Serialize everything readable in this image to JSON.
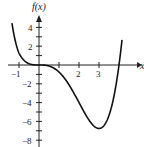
{
  "chart_data": {
    "type": "line",
    "title": "",
    "xlabel": "x",
    "ylabel": "f(x)",
    "x_ticks": [
      -1,
      1,
      2,
      3
    ],
    "x_tick_labels": [
      "-1",
      "",
      "2",
      "3"
    ],
    "y_tick_labels": [
      "4",
      "2",
      "-2",
      "-4",
      "-6",
      "-8"
    ],
    "y_ticks": [
      4,
      2,
      -2,
      -4,
      -6,
      -8
    ],
    "xlim": [
      -1.3,
      4.4
    ],
    "ylim": [
      -8,
      5
    ],
    "grid": false,
    "series": [
      {
        "name": "f(x)",
        "x": [
          -1.35,
          -1,
          -0.5,
          0,
          0.5,
          1,
          1.5,
          2,
          2.5,
          3,
          3.5,
          4,
          4.15
        ],
        "values": [
          4.5,
          1.25,
          0.14,
          0,
          -0.11,
          -0.75,
          -2.11,
          -4,
          -5.86,
          -6.75,
          -5.36,
          0,
          4.5
        ]
      }
    ],
    "annotations": [
      "local minimum near (3, -6.75)"
    ]
  },
  "labels": {
    "y_axis": "f(x)",
    "x_axis": "x",
    "xt_m1": "−1",
    "xt_2": "2",
    "xt_3": "3",
    "yt_4": "4",
    "yt_2": "2",
    "yt_m2": "−2",
    "yt_m4": "−4",
    "yt_m6": "−6",
    "yt_m8": "−8"
  }
}
